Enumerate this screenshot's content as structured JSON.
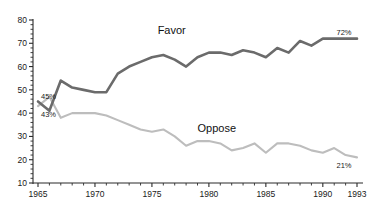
{
  "chart_data": {
    "type": "line",
    "title": "",
    "subtitle": "",
    "xlabel": "",
    "ylabel": "",
    "xlim": [
      1965,
      1993
    ],
    "ylim": [
      10,
      80
    ],
    "ytick_step": 10,
    "yminor_step": 2,
    "grid": false,
    "legend_position": "inline-annotation",
    "x": [
      1965,
      1966,
      1967,
      1968,
      1969,
      1970,
      1971,
      1972,
      1973,
      1974,
      1975,
      1976,
      1977,
      1978,
      1979,
      1980,
      1981,
      1982,
      1983,
      1984,
      1985,
      1986,
      1987,
      1988,
      1989,
      1990,
      1991,
      1992,
      1993
    ],
    "series": [
      {
        "name": "Favor",
        "color": "#6b6b6b",
        "values": [
          45,
          41,
          54,
          51,
          50,
          49,
          49,
          57,
          60,
          62,
          64,
          65,
          63,
          60,
          64,
          66,
          66,
          65,
          67,
          66,
          64,
          68,
          66,
          71,
          69,
          72,
          72,
          72,
          72
        ],
        "start_label": "45%",
        "end_label": "72%"
      },
      {
        "name": "Oppose",
        "color": "#bdbdbd",
        "values": [
          43,
          47,
          38,
          40,
          40,
          40,
          39,
          37,
          35,
          33,
          32,
          33,
          30,
          26,
          28,
          28,
          27,
          24,
          25,
          27,
          23,
          27,
          27,
          26,
          24,
          23,
          25,
          22,
          21
        ],
        "start_label": "43%",
        "end_label": "21%"
      }
    ],
    "ytick_labels": [
      "80",
      "70",
      "60",
      "50",
      "40",
      "30",
      "20",
      "10"
    ],
    "ytick_values": [
      80,
      70,
      60,
      50,
      40,
      30,
      20,
      10
    ],
    "xtick_labels": [
      "1965",
      "1970",
      "1975",
      "1980",
      "1985",
      "1990",
      "1993"
    ],
    "xtick_values": [
      1965,
      1970,
      1975,
      1980,
      1985,
      1990,
      1993
    ],
    "annotations": [
      {
        "text": "Favor",
        "x": 1975.5,
        "y": 74,
        "name": "favor-series-label"
      },
      {
        "text": "Oppose",
        "x": 1979.0,
        "y": 32,
        "name": "oppose-series-label"
      }
    ]
  },
  "labels": {
    "favor_name": "Favor",
    "oppose_name": "Oppose",
    "favor_start": "45%",
    "favor_end": "72%",
    "oppose_start": "43%",
    "oppose_end": "21%"
  },
  "colors": {
    "favor": "#6b6b6b",
    "oppose": "#bdbdbd",
    "axis": "#2b2b2b",
    "background": "#ffffff"
  }
}
